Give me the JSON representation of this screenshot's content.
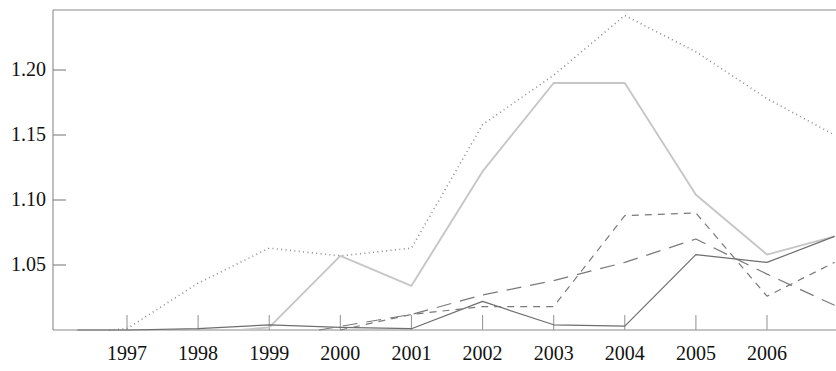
{
  "chart_data": {
    "type": "line",
    "title": "",
    "subtitle": "",
    "xlabel": "",
    "ylabel": "",
    "grid": false,
    "legend": "none",
    "categories": [
      "1997",
      "1998",
      "1999",
      "2000",
      "2001",
      "2002",
      "2003",
      "2004",
      "2005",
      "2006"
    ],
    "x_tick_labels": [
      "1997",
      "1998",
      "1999",
      "2000",
      "2001",
      "2002",
      "2003",
      "2004",
      "2005",
      "2006"
    ],
    "y_tick_labels": [
      "1.20",
      "1.15",
      "1.10",
      "1.05"
    ],
    "y_tick_values": [
      1.2,
      1.15,
      1.1,
      1.05
    ],
    "ylim": [
      0.998,
      1.253
    ],
    "xlim": [
      "1996.2",
      "2007.0"
    ],
    "series": [
      {
        "name": "series-dotted",
        "style": "dotted",
        "color": "#8d8d8d",
        "x": [
          "1996.75",
          "1997",
          "1998",
          "1999",
          "2000",
          "2001",
          "2002",
          "2003",
          "2004",
          "2005",
          "2006",
          "2006.95"
        ],
        "values": [
          1.0,
          1.001,
          1.036,
          1.063,
          1.057,
          1.063,
          1.158,
          1.196,
          1.242,
          1.214,
          1.178,
          1.15
        ]
      },
      {
        "name": "series-light-gray",
        "style": "solid-light",
        "color": "#c6c6c6",
        "x": [
          "1998.6",
          "1999",
          "2000",
          "2001",
          "2002",
          "2003",
          "2004",
          "2005",
          "2006",
          "2006.95"
        ],
        "values": [
          1.0,
          1.002,
          1.057,
          1.034,
          1.122,
          1.19,
          1.19,
          1.104,
          1.058,
          1.072
        ]
      },
      {
        "name": "series-solid-dark",
        "style": "solid",
        "color": "#6e6e6e",
        "x": [
          "1996.3",
          "1997",
          "1998",
          "1999",
          "2000",
          "2001",
          "2002",
          "2003",
          "2004",
          "2005",
          "2006",
          "2006.95"
        ],
        "values": [
          1.0,
          1.0,
          1.001,
          1.004,
          1.002,
          1.001,
          1.022,
          1.004,
          1.003,
          1.058,
          1.052,
          1.072
        ]
      },
      {
        "name": "series-short-dash",
        "style": "short-dash",
        "color": "#7a7a7a",
        "x": [
          "2000",
          "2001",
          "2002",
          "2003",
          "2004",
          "2005",
          "2006",
          "2006.95"
        ],
        "values": [
          1.0,
          1.012,
          1.018,
          1.018,
          1.088,
          1.09,
          1.026,
          1.052
        ]
      },
      {
        "name": "series-long-dash",
        "style": "long-dash",
        "color": "#7a7a7a",
        "x": [
          "1999.7",
          "2001",
          "2002",
          "2003",
          "2004",
          "2005",
          "2006",
          "2006.95"
        ],
        "values": [
          1.0,
          1.012,
          1.027,
          1.038,
          1.052,
          1.07,
          1.043,
          1.019
        ]
      }
    ]
  },
  "axes": {
    "y_labels": [
      {
        "text": "1.20",
        "value": 1.2
      },
      {
        "text": "1.15",
        "value": 1.15
      },
      {
        "text": "1.10",
        "value": 1.1
      },
      {
        "text": "1.05",
        "value": 1.05
      }
    ],
    "x_labels": [
      {
        "text": "1997"
      },
      {
        "text": "1998"
      },
      {
        "text": "1999"
      },
      {
        "text": "2000"
      },
      {
        "text": "2001"
      },
      {
        "text": "2002"
      },
      {
        "text": "2003"
      },
      {
        "text": "2004"
      },
      {
        "text": "2005"
      },
      {
        "text": "2006"
      }
    ]
  },
  "colors": {
    "background": "#ffffff",
    "axis": "#8a8a8a",
    "text": "#111111",
    "dotted_series": "#8d8d8d",
    "light_series": "#c6c6c6",
    "dark_series": "#6e6e6e",
    "dash_series": "#7a7a7a"
  }
}
